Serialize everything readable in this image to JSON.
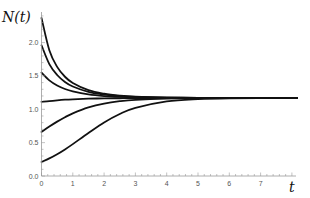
{
  "chart_data": {
    "type": "line",
    "title": "",
    "xlabel": "t",
    "ylabel": "N(t)",
    "xlim": [
      0,
      8.1
    ],
    "ylim": [
      0,
      2.4
    ],
    "grid": false,
    "legend": null,
    "x_ticks": [
      "0",
      "1",
      "2",
      "3",
      "4",
      "5",
      "6",
      "7"
    ],
    "y_ticks": [
      "0.0",
      "0.5",
      "1.0",
      "1.5",
      "2.0"
    ],
    "equilibrium": 1.17,
    "x": [
      0,
      0.25,
      0.5,
      0.75,
      1,
      1.5,
      2,
      2.5,
      3,
      4,
      5,
      6,
      8
    ],
    "series": [
      {
        "name": "N0=2.37",
        "values": [
          2.37,
          1.886,
          1.636,
          1.488,
          1.394,
          1.286,
          1.233,
          1.204,
          1.188,
          1.176,
          1.172,
          1.171,
          1.17
        ]
      },
      {
        "name": "N0=1.96",
        "values": [
          1.96,
          1.677,
          1.514,
          1.41,
          1.342,
          1.261,
          1.219,
          1.197,
          1.185,
          1.175,
          1.172,
          1.171,
          1.17
        ]
      },
      {
        "name": "N0=1.55",
        "values": [
          1.55,
          1.434,
          1.357,
          1.304,
          1.269,
          1.224,
          1.199,
          1.186,
          1.179,
          1.173,
          1.171,
          1.17,
          1.17
        ]
      },
      {
        "name": "N0=1.11",
        "values": [
          1.11,
          1.124,
          1.135,
          1.144,
          1.15,
          1.159,
          1.164,
          1.166,
          1.168,
          1.169,
          1.17,
          1.17,
          1.17
        ]
      },
      {
        "name": "N0=0.66",
        "values": [
          0.66,
          0.741,
          0.815,
          0.882,
          0.94,
          1.028,
          1.086,
          1.121,
          1.142,
          1.161,
          1.167,
          1.169,
          1.17
        ]
      },
      {
        "name": "N0=0.21",
        "values": [
          0.21,
          0.264,
          0.327,
          0.399,
          0.478,
          0.645,
          0.803,
          0.93,
          1.022,
          1.119,
          1.153,
          1.165,
          1.17
        ]
      }
    ]
  }
}
